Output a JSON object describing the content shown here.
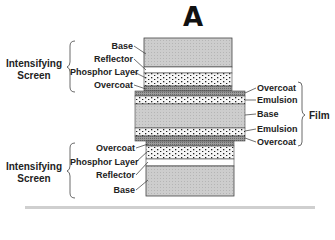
{
  "figure": {
    "title": "A",
    "top_screen": {
      "group_label": "Intensifying Screen",
      "layers": [
        "Base",
        "Reflector",
        "Phosphor Layer",
        "Overcoat"
      ]
    },
    "film": {
      "group_label": "Film",
      "layers": [
        "Overcoat",
        "Emulsion",
        "Base",
        "Emulsion",
        "Overcoat"
      ]
    },
    "bottom_screen": {
      "group_label": "Intensifying Screen",
      "layers": [
        "Overcoat",
        "Phosphor Layer",
        "Reflector",
        "Base"
      ]
    },
    "colors": {
      "base_fill": "#c8c8c8",
      "reflector_fill": "#ffffff",
      "phosphor_fill": "#f4f4f4",
      "phosphor_dot": "#222222",
      "overcoat_fill": "#8a8a8a",
      "outline": "#444444"
    }
  }
}
